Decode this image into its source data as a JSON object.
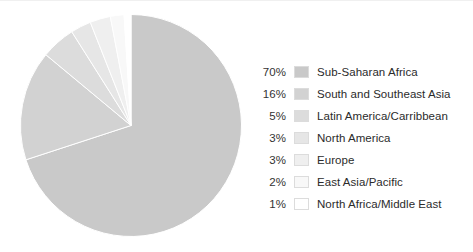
{
  "chart_data": {
    "type": "pie",
    "title": "",
    "categories": [
      "Sub-Saharan Africa",
      "South and Southeast Asia",
      "Latin America/Carribbean",
      "North America",
      "Europe",
      "East Asia/Pacific",
      "North Africa/Middle East"
    ],
    "values": [
      70,
      16,
      5,
      3,
      3,
      2,
      1
    ],
    "value_labels": [
      "70%",
      "16%",
      "5%",
      "3%",
      "3%",
      "2%",
      "1%"
    ],
    "unit": "%",
    "colors": [
      "#c9c9c9",
      "#d2d2d2",
      "#dcdcdc",
      "#e6e6e6",
      "#efefef",
      "#f8f8f8",
      "#ffffff"
    ],
    "slice_border_color": "#ffffff",
    "swatch_border_color": "#dcdcdc",
    "start_angle_deg": 0,
    "direction": "clockwise",
    "legend_position": "right",
    "grid": false,
    "xlabel": "",
    "ylabel": ""
  },
  "legend": {
    "rows": [
      {
        "pct": "70%",
        "label": "Sub-Saharan Africa",
        "color": "#c9c9c9"
      },
      {
        "pct": "16%",
        "label": "South and Southeast Asia",
        "color": "#d2d2d2"
      },
      {
        "pct": "5%",
        "label": "Latin America/Carribbean",
        "color": "#dcdcdc"
      },
      {
        "pct": "3%",
        "label": "North America",
        "color": "#e6e6e6"
      },
      {
        "pct": "3%",
        "label": "Europe",
        "color": "#efefef"
      },
      {
        "pct": "2%",
        "label": "East Asia/Pacific",
        "color": "#f8f8f8"
      },
      {
        "pct": "1%",
        "label": "North Africa/Middle East",
        "color": "#ffffff"
      }
    ]
  }
}
